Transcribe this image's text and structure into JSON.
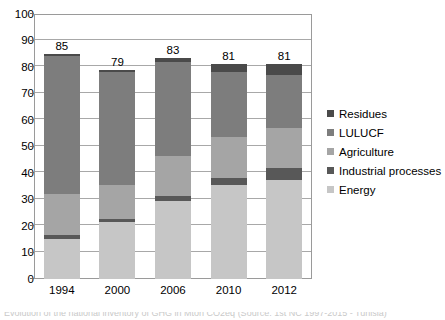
{
  "chart_data": {
    "type": "bar",
    "subtype": "stacked-column",
    "title": "",
    "xlabel": "",
    "ylabel": "",
    "ylim": [
      0,
      100
    ],
    "yticks": [
      0,
      10,
      20,
      30,
      40,
      50,
      60,
      70,
      80,
      90,
      100
    ],
    "ytick_labels": [
      "0",
      "10",
      "20",
      "30",
      "40",
      "50",
      "60",
      "70",
      "80",
      "90",
      "100"
    ],
    "grid": true,
    "grid_axis": "y",
    "legend_position": "right",
    "categories": [
      "1994",
      "2000",
      "2006",
      "2010",
      "2012"
    ],
    "series": [
      {
        "name": "Energy",
        "color": "#c6c6c6",
        "values": [
          15.0,
          21.5,
          29.5,
          35.5,
          37.5
        ]
      },
      {
        "name": "Industrial processes",
        "color": "#585858",
        "values": [
          1.5,
          1.0,
          2.0,
          2.5,
          4.5
        ]
      },
      {
        "name": "Agriculture",
        "color": "#a5a5a5",
        "values": [
          15.5,
          13.0,
          15.0,
          15.5,
          15.0
        ]
      },
      {
        "name": "LULUCF",
        "color": "#7d7d7d",
        "values": [
          52.0,
          42.5,
          35.5,
          24.5,
          20.0
        ]
      },
      {
        "name": "Residues",
        "color": "#4a4a4a",
        "values": [
          1.0,
          1.0,
          1.5,
          3.0,
          4.0
        ]
      }
    ],
    "totals": [
      85,
      79,
      83,
      81,
      81
    ],
    "total_labels": [
      "85",
      "79",
      "83",
      "81",
      "81"
    ]
  },
  "legend": {
    "items": [
      {
        "label": "Residues",
        "color": "#4a4a4a"
      },
      {
        "label": "LULUCF",
        "color": "#7d7d7d"
      },
      {
        "label": "Agriculture",
        "color": "#a5a5a5"
      },
      {
        "label": "Industrial processes",
        "color": "#585858"
      },
      {
        "label": "Energy",
        "color": "#c6c6c6"
      }
    ]
  },
  "caption": {
    "text": "Evolution of the national inventory of GHG in Mton CO2eq (Source: 1st NC 1997-2015 - Tunisia)"
  },
  "colors": {
    "axis": "#9a9a9a",
    "grid": "#a8a8a8",
    "plot_background": "#ffffff",
    "text": "#000000"
  }
}
